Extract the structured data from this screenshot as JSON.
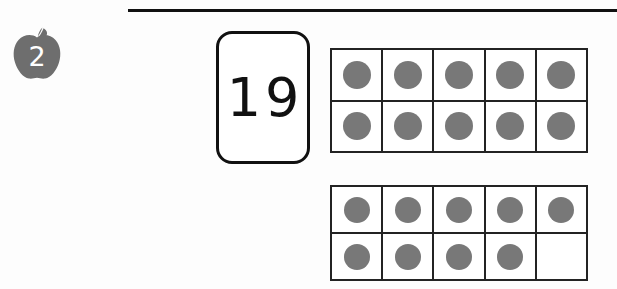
{
  "worksheet": {
    "question_number": "2",
    "apple_badge_icon": "apple-icon",
    "apple_badge_color": "#6e6e6e",
    "divider_color": "#111111",
    "number_card": {
      "value": "19",
      "border_color": "#111111"
    },
    "ten_frames": [
      {
        "name": "ten-frame-1",
        "filled_count": 10,
        "dot_color": "#787878",
        "rows": [
          [
            true,
            true,
            true,
            true,
            true
          ],
          [
            true,
            true,
            true,
            true,
            true
          ]
        ]
      },
      {
        "name": "ten-frame-2",
        "filled_count": 9,
        "dot_color": "#787878",
        "rows": [
          [
            true,
            true,
            true,
            true,
            true
          ],
          [
            true,
            true,
            true,
            true,
            false
          ]
        ]
      }
    ],
    "total_dots": "19"
  }
}
